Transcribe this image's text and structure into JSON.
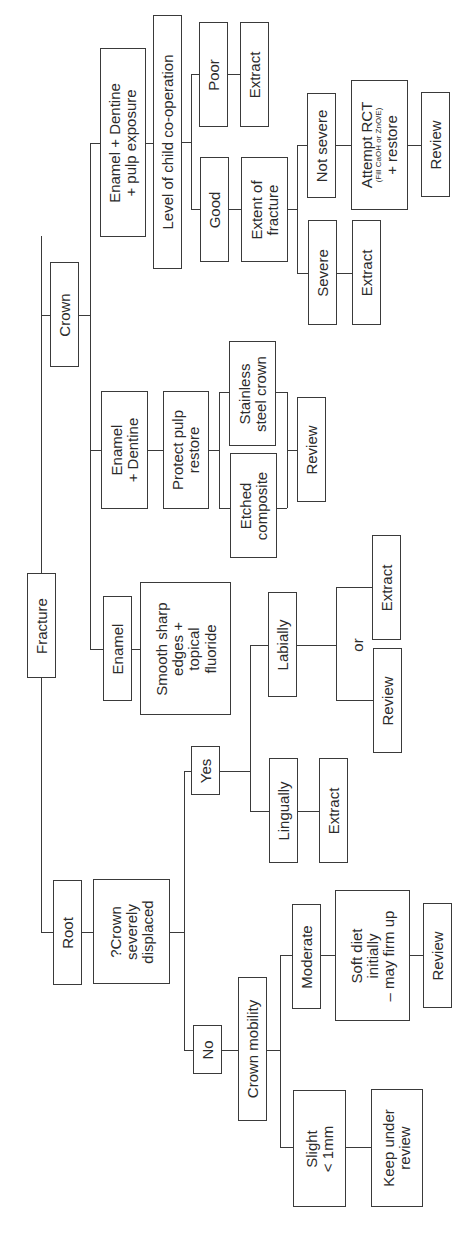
{
  "diagram": {
    "orientation": "rotated-90-ccw",
    "root": "Fracture",
    "nodes": {
      "fracture": "Fracture",
      "root": "Root",
      "crown": "Crown",
      "crown_displaced": "?Crown\nseverely\ndisplaced",
      "yes": "Yes",
      "no": "No",
      "lingually": "Lingually",
      "lingually_extract": "Extract",
      "labially": "Labially",
      "or": "or",
      "labially_review": "Review",
      "labially_extract": "Extract",
      "crown_mobility": "Crown mobility",
      "slight": "Slight\n< 1mm",
      "keep_under_review": "Keep under\nreview",
      "moderate": "Moderate",
      "soft_diet": "Soft diet\ninitially\n– may firm up",
      "moderate_review": "Review",
      "enamel": "Enamel",
      "smooth_edges": "Smooth sharp\nedges +\ntopical\nfluoride",
      "enamel_dentine": "Enamel\n+ Dentine",
      "protect_pulp": "Protect pulp\nrestore",
      "etched_composite": "Etched\ncomposite",
      "stainless_crown": "Stainless\nsteel crown",
      "ed_review": "Review",
      "enamel_dentine_pulp": "Enamel + Dentine\n+ pulp exposure",
      "cooperation": "Level of child co-operation",
      "poor": "Poor",
      "poor_extract": "Extract",
      "good": "Good",
      "extent": "Extent of\nfracture",
      "severe": "Severe",
      "severe_extract": "Extract",
      "not_severe": "Not severe",
      "rct_title": "Attempt RCT",
      "rct_note": "(Fill CaOH or ZnO/E)",
      "rct_restore": "+ restore",
      "rct_review": "Review"
    }
  }
}
